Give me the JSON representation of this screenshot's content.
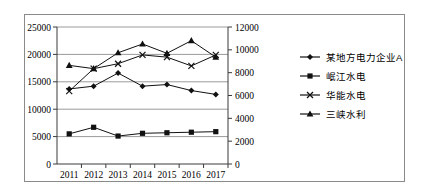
{
  "chart_data": {
    "type": "line",
    "title": "",
    "xlabel": "",
    "ylabel": "",
    "categories": [
      "2011",
      "2012",
      "2013",
      "2014",
      "2015",
      "2016",
      "2017"
    ],
    "grid": true,
    "legend_position": "right",
    "axes": {
      "left": {
        "ticks": [
          "0",
          "5000",
          "10000",
          "15000",
          "20000",
          "25000"
        ],
        "min": 0,
        "max": 25000,
        "step": 5000
      },
      "right": {
        "ticks": [
          "0",
          "2000",
          "4000",
          "6000",
          "8000",
          "10000",
          "12000"
        ],
        "min": 0,
        "max": 12000,
        "step": 2000
      }
    },
    "series": [
      {
        "name": "某地方电力企业A",
        "marker": "diamond",
        "axis": "left",
        "values": [
          13700,
          14200,
          16600,
          14200,
          14500,
          13400,
          12700
        ]
      },
      {
        "name": "岷江水电",
        "marker": "square",
        "axis": "left",
        "values": [
          5500,
          6700,
          5100,
          5600,
          5700,
          5800,
          5900
        ]
      },
      {
        "name": "华能水电",
        "marker": "cross",
        "axis": "left",
        "values": [
          13300,
          17400,
          18300,
          19900,
          19500,
          17900,
          19900
        ]
      },
      {
        "name": "三峡水利",
        "marker": "triangle",
        "axis": "left",
        "values": [
          18000,
          17400,
          20300,
          21900,
          20200,
          22500,
          19500
        ]
      }
    ]
  },
  "legend": {
    "items": [
      {
        "label": "某地方电力企业A",
        "marker": "diamond"
      },
      {
        "label": "岷江水电",
        "marker": "square"
      },
      {
        "label": "华能水电",
        "marker": "cross"
      },
      {
        "label": "三峡水利",
        "marker": "triangle"
      }
    ]
  }
}
